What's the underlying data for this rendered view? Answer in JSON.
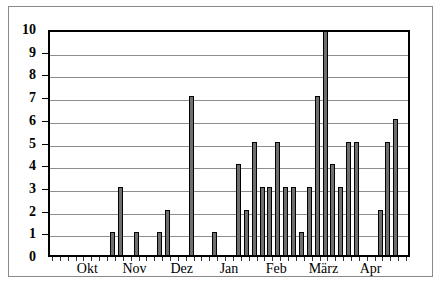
{
  "chart_data": {
    "type": "bar",
    "title": "",
    "subtitle": "",
    "xlabel": "",
    "ylabel": "",
    "ylim": [
      0,
      10
    ],
    "yticks": [
      0,
      1,
      2,
      3,
      4,
      5,
      6,
      7,
      8,
      9,
      10
    ],
    "ytick_labels": [
      "0",
      "1",
      "2",
      "3",
      "4",
      "5",
      "6",
      "7",
      "8",
      "9",
      "10"
    ],
    "grid": true,
    "grid_axis": "y",
    "legend": false,
    "legend_position": "none",
    "bar_color": "#6f6f6f",
    "bar_edge_color": "#000000",
    "axis_color": "#000000",
    "grid_color": "#8d8d8d",
    "month_labels": [
      "Okt",
      "Nov",
      "Dez",
      "Jan",
      "Feb",
      "März",
      "Apr"
    ],
    "month_label_positions": [
      4.5,
      10.5,
      16.5,
      22.5,
      28.5,
      34.5,
      40.5
    ],
    "categories": [
      "1",
      "2",
      "3",
      "4",
      "5",
      "6",
      "7",
      "8",
      "9",
      "10",
      "11",
      "12",
      "13",
      "14",
      "15",
      "16",
      "17",
      "18",
      "19",
      "20",
      "21",
      "22",
      "23",
      "24",
      "25",
      "26",
      "27",
      "28",
      "29",
      "30",
      "31",
      "32",
      "33",
      "34",
      "35",
      "36",
      "37",
      "38",
      "39",
      "40",
      "41",
      "42",
      "43",
      "44",
      "45"
    ],
    "values": [
      0,
      0,
      0,
      0,
      0,
      0,
      0,
      1,
      3,
      0,
      1,
      0,
      0,
      1,
      2,
      0,
      0,
      7,
      0,
      0,
      1,
      0,
      0,
      4,
      2,
      5,
      3,
      3,
      5,
      3,
      3,
      1,
      3,
      7,
      10,
      4,
      3,
      5,
      5,
      0,
      0,
      2,
      5,
      6,
      0
    ]
  }
}
